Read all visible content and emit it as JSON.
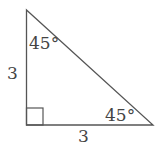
{
  "diagram": {
    "type": "right-triangle",
    "stroke_color": "#555555",
    "text_color": "#444444",
    "labels": {
      "top_angle": "45°",
      "bottom_right_angle": "45°",
      "left_side": "3",
      "bottom_side": "3"
    },
    "right_angle_marker": true
  }
}
